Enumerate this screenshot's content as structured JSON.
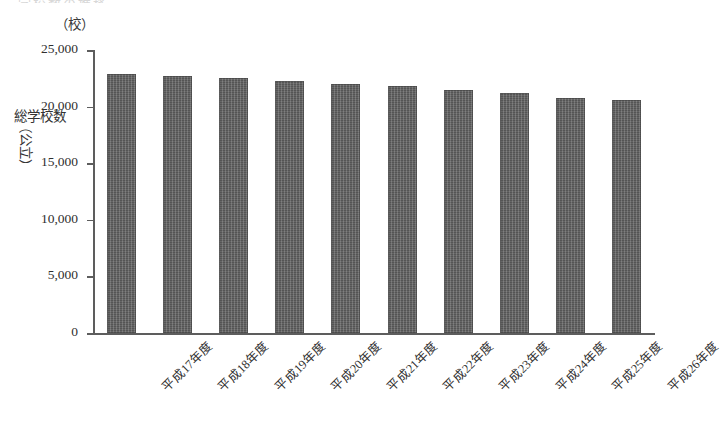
{
  "figure": {
    "clipped_header_text": "学校数の推移",
    "unit_label": "（校）",
    "y_axis_title_main": "総学校数",
    "y_axis_title_paren": "（公立）"
  },
  "chart_data": {
    "type": "bar",
    "title": "",
    "xlabel": "",
    "ylabel": "総学校数（公立）",
    "unit": "校",
    "ylim": [
      0,
      25000
    ],
    "grid": false,
    "legend": "none",
    "categories": [
      "平成17年度",
      "平成18年度",
      "平成19年度",
      "平成20年度",
      "平成21年度",
      "平成22年度",
      "平成23年度",
      "平成24年度",
      "平成25年度",
      "平成26年度"
    ],
    "values": [
      22900,
      22700,
      22500,
      22250,
      22000,
      21800,
      21500,
      21200,
      20800,
      20550
    ],
    "ytick_labels": [
      "0",
      "5,000",
      "10,000",
      "15,000",
      "20,000",
      "25,000"
    ],
    "ytick_values": [
      0,
      5000,
      10000,
      15000,
      20000,
      25000
    ],
    "bar_color": "#5e5e5e",
    "axis_color": "#5d5d5d"
  }
}
